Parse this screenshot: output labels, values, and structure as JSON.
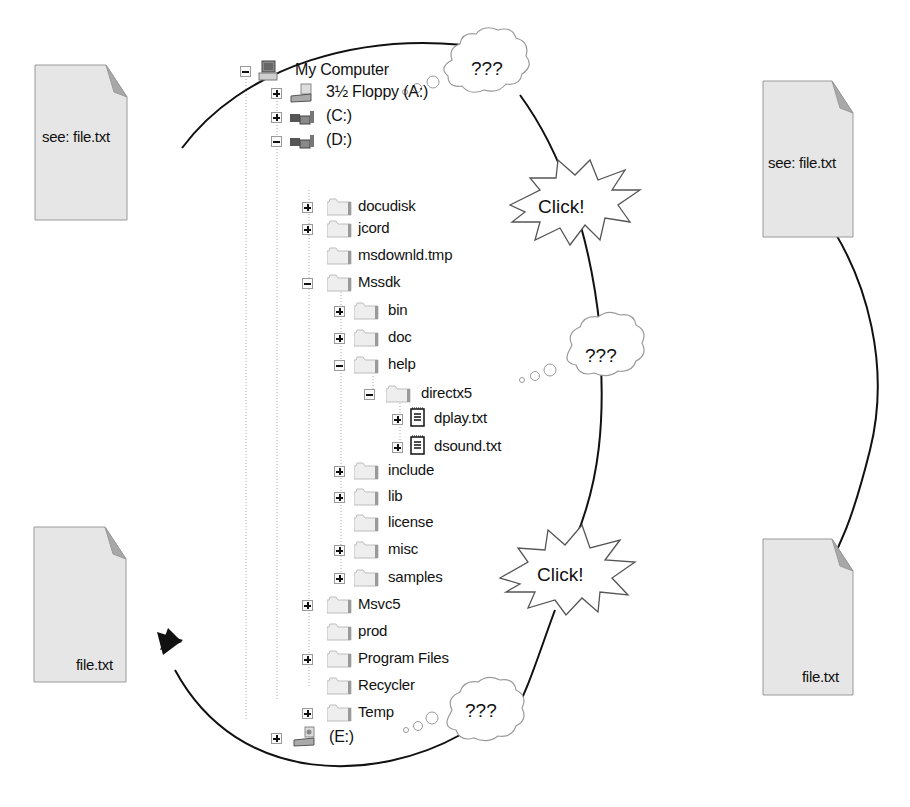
{
  "documents": {
    "left_top": {
      "label": "see: file.txt"
    },
    "left_bottom": {
      "label": "file.txt"
    },
    "right_top": {
      "label": "see: file.txt"
    },
    "right_bottom": {
      "label": "file.txt"
    }
  },
  "callouts": {
    "thought_top": "???",
    "click_top": "Click!",
    "thought_middle": "???",
    "click_bottom": "Click!",
    "thought_bottom": "???"
  },
  "tree": {
    "nodes": [
      {
        "label": "My Computer",
        "icon": "computer-icon",
        "expander": "minus"
      },
      {
        "label": "3½ Floppy (A:)",
        "icon": "floppy-drive-icon",
        "expander": "plus"
      },
      {
        "label": "(C:)",
        "icon": "hard-drive-icon",
        "expander": "plus"
      },
      {
        "label": "(D:)",
        "icon": "hard-drive-icon",
        "expander": "minus"
      },
      {
        "label": "docudisk",
        "icon": "folder-icon",
        "expander": "plus"
      },
      {
        "label": "jcord",
        "icon": "folder-icon",
        "expander": "plus"
      },
      {
        "label": "msdownld.tmp",
        "icon": "folder-icon",
        "expander": "none"
      },
      {
        "label": "Mssdk",
        "icon": "folder-icon",
        "expander": "minus"
      },
      {
        "label": "bin",
        "icon": "folder-icon",
        "expander": "plus"
      },
      {
        "label": "doc",
        "icon": "folder-icon",
        "expander": "plus"
      },
      {
        "label": "help",
        "icon": "folder-icon",
        "expander": "minus"
      },
      {
        "label": "directx5",
        "icon": "folder-icon",
        "expander": "minus"
      },
      {
        "label": "dplay.txt",
        "icon": "text-file-icon",
        "expander": "plus"
      },
      {
        "label": "dsound.txt",
        "icon": "text-file-icon",
        "expander": "plus"
      },
      {
        "label": "include",
        "icon": "folder-icon",
        "expander": "plus"
      },
      {
        "label": "lib",
        "icon": "folder-icon",
        "expander": "plus"
      },
      {
        "label": "license",
        "icon": "folder-icon",
        "expander": "none"
      },
      {
        "label": "misc",
        "icon": "folder-icon",
        "expander": "plus"
      },
      {
        "label": "samples",
        "icon": "folder-icon",
        "expander": "plus"
      },
      {
        "label": "Msvc5",
        "icon": "folder-icon",
        "expander": "plus"
      },
      {
        "label": "prod",
        "icon": "folder-icon",
        "expander": "none"
      },
      {
        "label": "Program Files",
        "icon": "folder-icon",
        "expander": "plus"
      },
      {
        "label": "Recycler",
        "icon": "folder-icon",
        "expander": "none"
      },
      {
        "label": "Temp",
        "icon": "folder-icon",
        "expander": "plus"
      },
      {
        "label": "(E:)",
        "icon": "cd-drive-icon",
        "expander": "plus"
      }
    ]
  },
  "colors": {
    "document_fill": "#e6e6e6",
    "document_border": "#9a9a9a",
    "document_fold": "#a8a8a8",
    "arrow": "#111111",
    "tree_line": "#aaaaaa"
  }
}
